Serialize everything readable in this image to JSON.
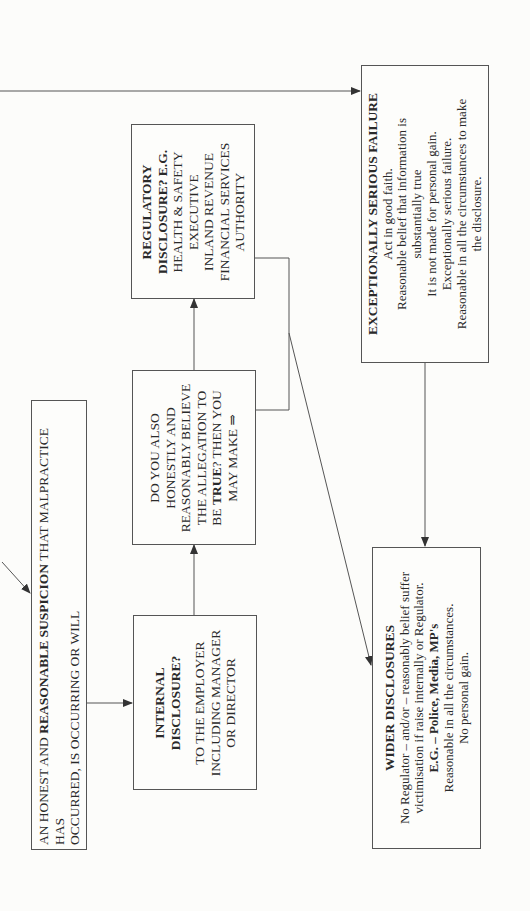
{
  "diagram": {
    "type": "flowchart",
    "orientation": "rotated-90-ccw",
    "nodes": {
      "start": {
        "lines": [
          {
            "pre": "AN HONEST AND ",
            "bold": "REASONABLE SUSPICION",
            "post": " THAT MALPRACTICE HAS"
          },
          {
            "pre": "OCCURRED, IS OCCURRING OR WILL",
            "bold": "",
            "post": ""
          }
        ]
      },
      "internal": {
        "title_lines": [
          "INTERNAL",
          "DISCLOSURE?"
        ],
        "body_lines": [
          "TO THE EMPLOYER",
          "INCLUDING MANAGER",
          "OR DIRECTOR"
        ]
      },
      "belief": {
        "lines": [
          "DO YOU ALSO",
          "HONESTLY AND",
          "REASONABLY BELIEVE",
          "THE ALLEGATION TO"
        ],
        "last_pre": "BE ",
        "last_bold": "TRUE",
        "last_post": "? THEN YOU",
        "final_line": "MAY MAKE ⇒"
      },
      "regulatory": {
        "title_lines": [
          "REGULATORY",
          "DISCLOSURE? E.G."
        ],
        "body_lines": [
          "HEALTH & SAFETY",
          "EXECUTIVE",
          "INLAND REVENUE",
          "FINANCIAL SERVICES",
          "AUTHORITY"
        ]
      },
      "exceptional": {
        "title": "EXCEPTIONALLY SERIOUS FAILURE",
        "body_lines": [
          "Act in good faith.",
          "Reasonable belief that information is",
          "substantially true",
          "It is not made for personal gain.",
          "Exceptionally serious failure.",
          "Reasonable in all the circumstances to make",
          "the disclosure."
        ]
      },
      "wider": {
        "title": "WIDER DISCLOSURES",
        "body_lines": [
          "No Regulator – and/or – reasonably belief suffer",
          "victimisation if raise internally or Regulator."
        ],
        "eg_pre": "E.G. – ",
        "eg_bold": "Police, Media, MP's",
        "tail_lines": [
          "Reasonable in all the circumstances.",
          "No personal gain."
        ]
      }
    },
    "edges": [
      {
        "from": "start",
        "to": "internal"
      },
      {
        "from": "internal",
        "to": "belief"
      },
      {
        "from": "belief",
        "to": "regulatory"
      },
      {
        "from": "regulatory",
        "to": "wider"
      },
      {
        "from": "entry",
        "to": "exceptional"
      },
      {
        "from": "entry",
        "to": "start"
      },
      {
        "from": "exceptional",
        "to": "wider"
      }
    ],
    "colors": {
      "line": "#555555",
      "text": "#2a2a2a",
      "background": "#fcfcfa"
    }
  }
}
